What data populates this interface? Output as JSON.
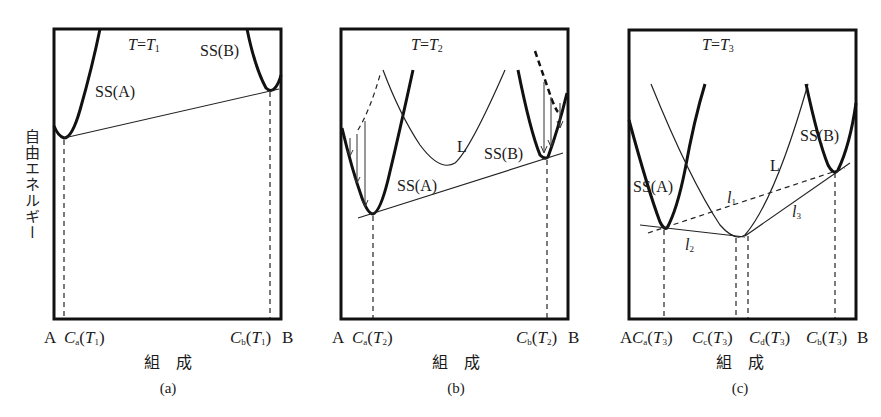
{
  "figure": {
    "y_axis_label": "自由エネルギー",
    "panels": [
      {
        "id": "a",
        "caption": "(a)",
        "temperature_label": {
          "T": "T",
          "eq": "=",
          "Tsym": "T",
          "sub": "1"
        },
        "curve_labels": {
          "ss_a": "SS(A)",
          "ss_b": "SS(B)"
        },
        "x_axis": {
          "left_end": "A",
          "right_end": "B",
          "ticks": [
            {
              "C": "C",
              "sub": "a",
              "T": "T",
              "Tsub": "1"
            },
            {
              "C": "C",
              "sub": "b",
              "T": "T",
              "Tsub": "1"
            }
          ],
          "title": "組　成"
        }
      },
      {
        "id": "b",
        "caption": "(b)",
        "temperature_label": {
          "T": "T",
          "eq": "=",
          "Tsym": "T",
          "sub": "2"
        },
        "curve_labels": {
          "ss_a": "SS(A)",
          "ss_b": "SS(B)",
          "liquid": "L"
        },
        "x_axis": {
          "left_end": "A",
          "right_end": "B",
          "ticks": [
            {
              "C": "C",
              "sub": "a",
              "T": "T",
              "Tsub": "2"
            },
            {
              "C": "C",
              "sub": "b",
              "T": "T",
              "Tsub": "2"
            }
          ],
          "title": "組　成"
        }
      },
      {
        "id": "c",
        "caption": "(c)",
        "temperature_label": {
          "T": "T",
          "eq": "=",
          "Tsym": "T",
          "sub": "3"
        },
        "curve_labels": {
          "ss_a": "SS(A)",
          "ss_b": "SS(B)",
          "liquid": "L"
        },
        "tangent_labels": {
          "l1": "l",
          "l1sub": "1",
          "l2": "l",
          "l2sub": "2",
          "l3": "l",
          "l3sub": "3"
        },
        "x_axis": {
          "left_end": "A",
          "right_end": "B",
          "ticks": [
            {
              "C": "C",
              "sub": "a",
              "T": "T",
              "Tsub": "3"
            },
            {
              "C": "C",
              "sub": "c",
              "T": "T",
              "Tsub": "3"
            },
            {
              "C": "C",
              "sub": "d",
              "T": "T",
              "Tsub": "3"
            },
            {
              "C": "C",
              "sub": "b",
              "T": "T",
              "Tsub": "3"
            }
          ],
          "title": "組　成"
        }
      }
    ]
  }
}
